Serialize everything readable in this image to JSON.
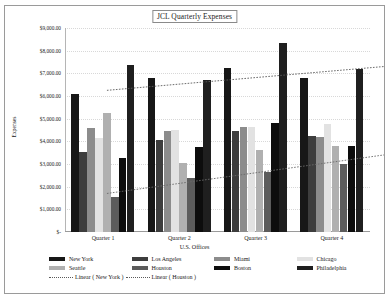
{
  "chart_data": {
    "type": "bar",
    "title": "JCL Quarterly Expenses",
    "xlabel": "U.S. Offices",
    "ylabel": "Expenses",
    "categories": [
      "Quarter 1",
      "Quarter 2",
      "Quarter 3",
      "Quarter 4"
    ],
    "ylim": [
      0,
      9000
    ],
    "ytick_values": [
      0,
      1000,
      2000,
      3000,
      4000,
      5000,
      6000,
      7000,
      8000,
      9000
    ],
    "ytick_labels": [
      "$-",
      "$1,000.00",
      "$2,000.00",
      "$3,000.00",
      "$4,000.00",
      "$5,000.00",
      "$6,000.00",
      "$7,000.00",
      "$8,000.00",
      "$9,000.00"
    ],
    "grid": false,
    "legend_position": "bottom",
    "series": [
      {
        "name": "New York",
        "color": "#171717",
        "values": [
          6100,
          6800,
          7250,
          6800
        ]
      },
      {
        "name": "Los Angeles",
        "color": "#3d3d3d",
        "values": [
          3550,
          4050,
          4450,
          4250
        ]
      },
      {
        "name": "Miami",
        "color": "#8c8c8c",
        "values": [
          4600,
          4450,
          4650,
          4200
        ]
      },
      {
        "name": "Chicago",
        "color": "#e2e2e2",
        "values": [
          4150,
          4500,
          4650,
          4750
        ]
      },
      {
        "name": "Seattle",
        "color": "#b0b0b0",
        "values": [
          5250,
          3050,
          3600,
          3800
        ]
      },
      {
        "name": "Houston",
        "color": "#5c5c5c",
        "values": [
          1550,
          2400,
          2650,
          3000
        ]
      },
      {
        "name": "Boston",
        "color": "#0d0d0d",
        "values": [
          3250,
          3750,
          4800,
          3800
        ]
      },
      {
        "name": "Philadelphia",
        "color": "#1f1f1f",
        "values": [
          7350,
          6700,
          8350,
          7200
        ]
      }
    ],
    "trendlines": [
      {
        "name": "Linear ( New York )",
        "style": "dotted",
        "color": "#5a5a5a",
        "start_value": 6250,
        "end_value": 7300
      },
      {
        "name": "Linear ( Houston )",
        "style": "dotted",
        "color": "#6a6a6a",
        "start_value": 1700,
        "end_value": 3400
      }
    ]
  },
  "legend": {
    "rows": [
      [
        "New York",
        "Los Angeles",
        "Miami",
        "Chicago"
      ],
      [
        "Seattle",
        "Houston",
        "Boston",
        "Philadelphia"
      ]
    ],
    "trend_labels": [
      "Linear ( New York )",
      "Linear ( Houston )"
    ]
  }
}
